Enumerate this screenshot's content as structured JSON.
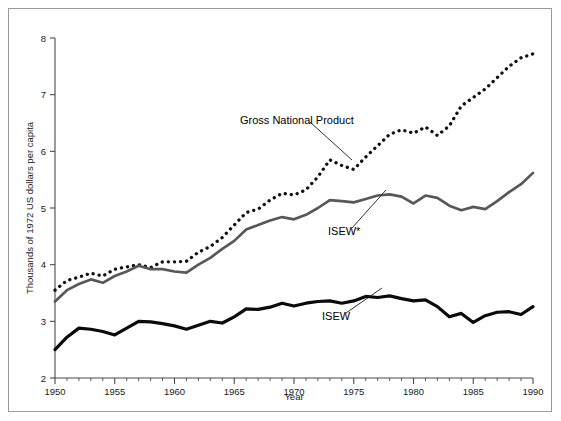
{
  "chart_data": {
    "type": "line",
    "title": "",
    "xlabel": "Year",
    "ylabel": "Thousands of 1972 US dollars per capita",
    "xlim": [
      1950,
      1990
    ],
    "ylim": [
      2,
      8
    ],
    "xticks": [
      1950,
      1955,
      1960,
      1965,
      1970,
      1975,
      1980,
      1985,
      1990
    ],
    "xtick_labels": [
      "1950",
      "1955",
      "1960",
      "1965",
      "1970",
      "1975",
      "1980",
      "1985",
      "1990"
    ],
    "yticks": [
      2,
      3,
      4,
      5,
      6,
      7,
      8
    ],
    "ytick_labels": [
      "2",
      "3",
      "4",
      "5",
      "6",
      "7",
      "8"
    ],
    "minor_xtick_interval": 1,
    "grid": false,
    "legend": "inline-annotations",
    "x": [
      1950,
      1951,
      1952,
      1953,
      1954,
      1955,
      1956,
      1957,
      1958,
      1959,
      1960,
      1961,
      1962,
      1963,
      1964,
      1965,
      1966,
      1967,
      1968,
      1969,
      1970,
      1971,
      1972,
      1973,
      1974,
      1975,
      1976,
      1977,
      1978,
      1979,
      1980,
      1981,
      1982,
      1983,
      1984,
      1985,
      1986,
      1987,
      1988,
      1989,
      1990
    ],
    "series": [
      {
        "name": "Gross National Product",
        "style": "dotted",
        "color": "#111111",
        "values": [
          3.55,
          3.72,
          3.78,
          3.85,
          3.8,
          3.92,
          3.96,
          4.0,
          3.95,
          4.05,
          4.05,
          4.06,
          4.22,
          4.32,
          4.48,
          4.7,
          4.92,
          4.98,
          5.14,
          5.26,
          5.23,
          5.32,
          5.55,
          5.85,
          5.75,
          5.68,
          5.9,
          6.1,
          6.3,
          6.38,
          6.32,
          6.43,
          6.28,
          6.45,
          6.8,
          6.95,
          7.1,
          7.3,
          7.5,
          7.65,
          7.72
        ]
      },
      {
        "name": "ISEW*",
        "style": "solid",
        "color": "#585858",
        "values": [
          3.35,
          3.55,
          3.66,
          3.74,
          3.68,
          3.8,
          3.88,
          3.98,
          3.92,
          3.92,
          3.88,
          3.86,
          4.0,
          4.12,
          4.28,
          4.42,
          4.62,
          4.7,
          4.78,
          4.84,
          4.8,
          4.88,
          5.0,
          5.14,
          5.12,
          5.1,
          5.16,
          5.22,
          5.24,
          5.2,
          5.08,
          5.22,
          5.18,
          5.04,
          4.96,
          5.02,
          4.98,
          5.12,
          5.28,
          5.42,
          5.62
        ]
      },
      {
        "name": "ISEW",
        "style": "solid",
        "color": "#0a0a0a",
        "values": [
          2.5,
          2.72,
          2.88,
          2.86,
          2.82,
          2.76,
          2.88,
          3.0,
          2.99,
          2.96,
          2.92,
          2.86,
          2.93,
          3.0,
          2.97,
          3.08,
          3.22,
          3.21,
          3.25,
          3.32,
          3.27,
          3.32,
          3.35,
          3.36,
          3.32,
          3.36,
          3.44,
          3.42,
          3.45,
          3.4,
          3.36,
          3.38,
          3.26,
          3.08,
          3.14,
          2.98,
          3.1,
          3.16,
          3.17,
          3.12,
          3.26
        ]
      }
    ],
    "annotations": [
      {
        "text": "Gross National Product",
        "target_series": "Gross National Product",
        "x": 240,
        "y": 124
      },
      {
        "text": "ISEW*",
        "target_series": "ISEW*",
        "x": 328,
        "y": 235
      },
      {
        "text": "ISEW",
        "target_series": "ISEW",
        "x": 322,
        "y": 320
      }
    ]
  },
  "colors": {
    "background": "#ffffff",
    "frame": "#9a9a9a",
    "axis": "#4a4a4a",
    "gnp": "#111111",
    "isew_star": "#585858",
    "isew": "#0a0a0a",
    "text": "#1a1a1a"
  }
}
